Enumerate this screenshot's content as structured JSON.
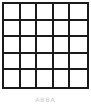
{
  "diagram": {
    "type": "grid",
    "rows": 5,
    "columns": 5,
    "line_color": "#1a1a1a",
    "cell_fill": "#ffffff",
    "cells_filled": []
  },
  "caption": "ABBA"
}
